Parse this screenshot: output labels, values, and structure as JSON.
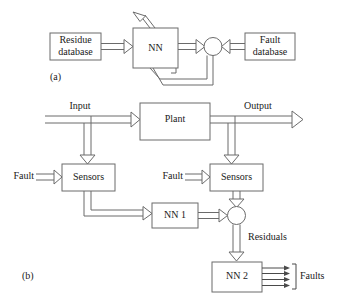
{
  "figure": {
    "panel_a": {
      "label": "(a)",
      "boxes": [
        {
          "id": "residue-database",
          "lines": [
            "Residue",
            "database"
          ]
        },
        {
          "id": "nn",
          "lines": [
            "NN"
          ]
        },
        {
          "id": "fault-database",
          "lines": [
            "Fault",
            "database"
          ]
        }
      ],
      "junction": {
        "id": "summing-junction-a",
        "shape": "circle"
      }
    },
    "panel_b": {
      "label": "(b)",
      "boxes": [
        {
          "id": "plant",
          "lines": [
            "Plant"
          ]
        },
        {
          "id": "sensors-left",
          "lines": [
            "Sensors"
          ]
        },
        {
          "id": "sensors-right",
          "lines": [
            "Sensors"
          ]
        },
        {
          "id": "nn-1",
          "lines": [
            "NN 1"
          ]
        },
        {
          "id": "nn-2",
          "lines": [
            "NN 2"
          ]
        }
      ],
      "signal_labels": [
        {
          "id": "input",
          "text": "Input"
        },
        {
          "id": "output",
          "text": "Output"
        },
        {
          "id": "fault-left",
          "text": "Fault"
        },
        {
          "id": "fault-right",
          "text": "Fault"
        },
        {
          "id": "residuals",
          "text": "Residuals"
        },
        {
          "id": "faults-out",
          "text": "Faults"
        }
      ],
      "junction": {
        "id": "summing-junction-b",
        "shape": "circle"
      },
      "faults_arrow_count": 4
    }
  },
  "colors": {
    "stroke": "#6b6b6b",
    "text": "#1a1a1a",
    "background": "#ffffff"
  }
}
